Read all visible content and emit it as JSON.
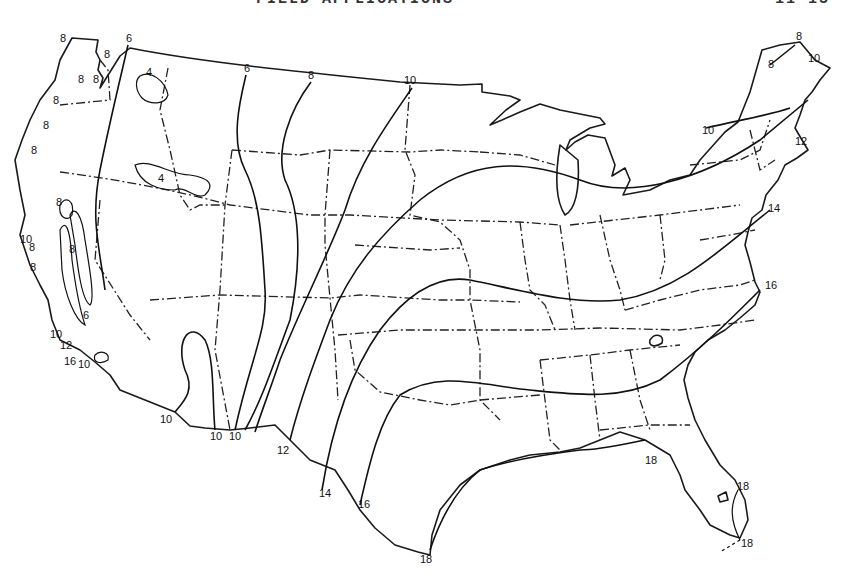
{
  "header": {
    "title": "FIELD APPLICATIONS",
    "page": "11-13"
  },
  "map": {
    "subject": "Contour map of the contiguous United States with isolines",
    "isoline_values": [
      4,
      6,
      8,
      10,
      12,
      14,
      16,
      18
    ],
    "labels": [
      {
        "id": "nw-8a",
        "text": "8",
        "x": 60,
        "y": 38
      },
      {
        "id": "nw-6",
        "text": "6",
        "x": 128,
        "y": 38
      },
      {
        "id": "nw-8b",
        "text": "8",
        "x": 106,
        "y": 56
      },
      {
        "id": "nw-8c",
        "text": "8",
        "x": 80,
        "y": 80
      },
      {
        "id": "nw-8d",
        "text": "8",
        "x": 95,
        "y": 80
      },
      {
        "id": "nw-8e",
        "text": "8",
        "x": 55,
        "y": 102
      },
      {
        "id": "nw-8f",
        "text": "8",
        "x": 45,
        "y": 127
      },
      {
        "id": "nw-8g",
        "text": "8",
        "x": 33,
        "y": 152
      },
      {
        "id": "id-4a",
        "text": "4",
        "x": 148,
        "y": 73
      },
      {
        "id": "id-4b",
        "text": "4",
        "x": 160,
        "y": 180
      },
      {
        "id": "ca-8a",
        "text": "8",
        "x": 58,
        "y": 203
      },
      {
        "id": "ca-10a",
        "text": "10",
        "x": 24,
        "y": 240
      },
      {
        "id": "ca-8b",
        "text": "8",
        "x": 31,
        "y": 248
      },
      {
        "id": "ca-8c",
        "text": "8",
        "x": 71,
        "y": 250
      },
      {
        "id": "ca-8d",
        "text": "8",
        "x": 32,
        "y": 268
      },
      {
        "id": "ca-6",
        "text": "6",
        "x": 85,
        "y": 316
      },
      {
        "id": "ca-10b",
        "text": "10",
        "x": 53,
        "y": 335
      },
      {
        "id": "ca-12",
        "text": "12",
        "x": 62,
        "y": 346
      },
      {
        "id": "ca-16",
        "text": "16",
        "x": 66,
        "y": 362
      },
      {
        "id": "ca-10c",
        "text": "10",
        "x": 80,
        "y": 365
      },
      {
        "id": "n-6",
        "text": "6",
        "x": 246,
        "y": 70
      },
      {
        "id": "n-8",
        "text": "8",
        "x": 311,
        "y": 77
      },
      {
        "id": "n-10",
        "text": "10",
        "x": 407,
        "y": 82
      },
      {
        "id": "sw-10a",
        "text": "10",
        "x": 163,
        "y": 420
      },
      {
        "id": "sw-10b",
        "text": "10",
        "x": 212,
        "y": 437
      },
      {
        "id": "sw-10c",
        "text": "10",
        "x": 231,
        "y": 437
      },
      {
        "id": "s-12",
        "text": "12",
        "x": 280,
        "y": 451
      },
      {
        "id": "s-14",
        "text": "14",
        "x": 322,
        "y": 494
      },
      {
        "id": "s-16",
        "text": "16",
        "x": 360,
        "y": 505
      },
      {
        "id": "s-18a",
        "text": "18",
        "x": 422,
        "y": 561
      },
      {
        "id": "se-18b",
        "text": "18",
        "x": 647,
        "y": 462
      },
      {
        "id": "se-18c",
        "text": "18",
        "x": 739,
        "y": 488
      },
      {
        "id": "se-18d",
        "text": "18",
        "x": 743,
        "y": 545
      },
      {
        "id": "ne-8a",
        "text": "8",
        "x": 798,
        "y": 39
      },
      {
        "id": "ne-8b",
        "text": "8",
        "x": 770,
        "y": 66
      },
      {
        "id": "ne-10a",
        "text": "10",
        "x": 810,
        "y": 60
      },
      {
        "id": "ne-10b",
        "text": "10",
        "x": 703,
        "y": 132
      },
      {
        "id": "ne-12",
        "text": "12",
        "x": 795,
        "y": 143
      },
      {
        "id": "ne-14",
        "text": "14",
        "x": 768,
        "y": 210
      },
      {
        "id": "e-16",
        "text": "16",
        "x": 765,
        "y": 287
      }
    ]
  }
}
